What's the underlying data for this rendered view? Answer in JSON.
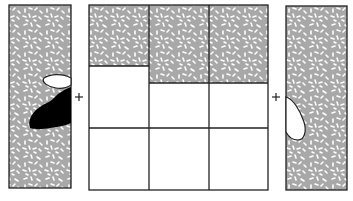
{
  "figure": {
    "operators": [
      "+",
      "+"
    ],
    "colors": {
      "texture_fill": "#a8a8a8",
      "texture_flecks": "#ffffff",
      "outline": "#222222",
      "dark_blob": "#000000",
      "background": "#ffffff"
    },
    "grid": {
      "columns": 3,
      "rows": 3,
      "filled_top": {
        "left_column_to_y": 66,
        "middle_column_to_y": 83,
        "right_column_to_y": 83
      }
    }
  }
}
